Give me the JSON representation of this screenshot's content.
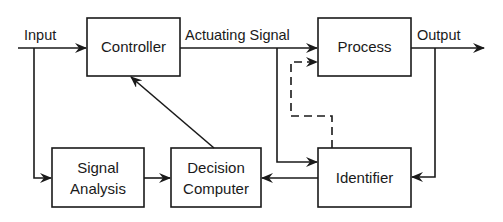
{
  "diagram": {
    "type": "block-diagram",
    "blocks": [
      {
        "id": "controller",
        "label": "Controller"
      },
      {
        "id": "process",
        "label": "Process"
      },
      {
        "id": "signal_analysis",
        "label_line1": "Signal",
        "label_line2": "Analysis"
      },
      {
        "id": "decision_computer",
        "label_line1": "Decision",
        "label_line2": "Computer"
      },
      {
        "id": "identifier",
        "label": "Identifier"
      }
    ],
    "signals": {
      "input": "Input",
      "actuating": "Actuating Signal",
      "output": "Output"
    },
    "connections": [
      {
        "from": "input",
        "to": "controller",
        "style": "solid"
      },
      {
        "from": "input",
        "to": "signal_analysis",
        "style": "solid"
      },
      {
        "from": "controller",
        "to": "process",
        "label": "Actuating Signal",
        "style": "solid"
      },
      {
        "from": "actuating_signal",
        "to": "identifier",
        "style": "solid"
      },
      {
        "from": "process",
        "to": "output",
        "style": "solid"
      },
      {
        "from": "output",
        "to": "identifier",
        "style": "solid"
      },
      {
        "from": "signal_analysis",
        "to": "decision_computer",
        "style": "solid"
      },
      {
        "from": "identifier",
        "to": "decision_computer",
        "style": "solid"
      },
      {
        "from": "decision_computer",
        "to": "controller",
        "style": "solid"
      },
      {
        "from": "identifier",
        "to": "process",
        "style": "dashed"
      }
    ]
  }
}
